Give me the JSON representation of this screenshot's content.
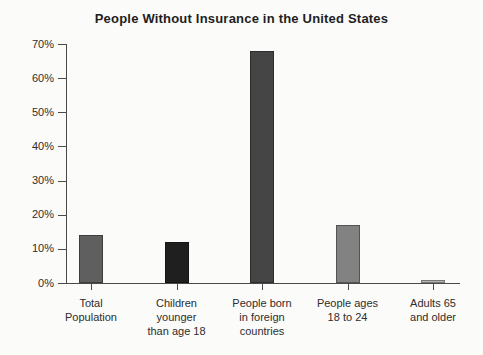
{
  "title": "People Without Insurance in the United States",
  "colors": {
    "background": "#fbfbf9",
    "axis": "#4a4a4a",
    "text": "#2d2d2d"
  },
  "chart_data": {
    "type": "bar",
    "title": "People Without Insurance in the United States",
    "categories": [
      "Total Population",
      "Children younger than age 18",
      "People born in foreign countries",
      "People ages 18 to 24",
      "Adults 65 and older"
    ],
    "category_lines": [
      [
        "Total",
        "Population"
      ],
      [
        "Children",
        "younger",
        "than age 18"
      ],
      [
        "People born",
        "in foreign",
        "countries"
      ],
      [
        "People ages",
        "18 to 24"
      ],
      [
        "Adults 65",
        "and older"
      ]
    ],
    "values": [
      14,
      12,
      68,
      17,
      1
    ],
    "unit": "%",
    "bar_colors": [
      "#5f5f5f",
      "#1f1f1f",
      "#454545",
      "#828282",
      "#b5b5b5"
    ],
    "xlabel": "",
    "ylabel": "",
    "ylim": [
      0,
      70
    ],
    "y_ticks": [
      "0%",
      "10%",
      "20%",
      "30%",
      "40%",
      "50%",
      "60%",
      "70%"
    ],
    "y_tick_values": [
      0,
      10,
      20,
      30,
      40,
      50,
      60,
      70
    ],
    "grid": false,
    "legend": false
  }
}
